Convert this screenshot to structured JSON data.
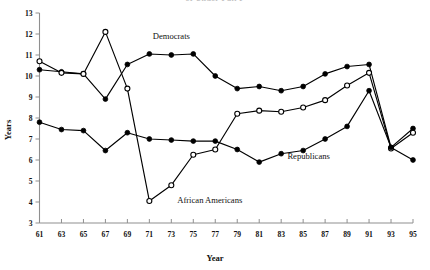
{
  "page": {
    "top_partial_title": "of Under Full P"
  },
  "chart_data": {
    "type": "line",
    "title": "",
    "xlabel": "Year",
    "ylabel": "Years",
    "xlim": [
      61,
      95
    ],
    "ylim": [
      3,
      13
    ],
    "grid": false,
    "legend": "inline-annotations",
    "x_tick_labels": [
      "61",
      "63",
      "65",
      "67",
      "69",
      "71",
      "73",
      "75",
      "77",
      "79",
      "81",
      "83",
      "85",
      "87",
      "89",
      "91",
      "93",
      "95"
    ],
    "y_tick_labels": [
      "3",
      "4",
      "5",
      "6",
      "7",
      "8",
      "9",
      "10",
      "11",
      "12",
      "13"
    ],
    "categories": [
      61,
      63,
      65,
      67,
      69,
      71,
      73,
      75,
      77,
      79,
      81,
      83,
      85,
      87,
      89,
      91,
      93,
      95
    ],
    "series": [
      {
        "name": "Democrats",
        "marker": "filled-circle",
        "label_x": 73,
        "label_y": 11.75,
        "values": [
          10.3,
          10.2,
          10.1,
          8.9,
          10.55,
          11.05,
          11.0,
          11.05,
          10.0,
          9.4,
          9.5,
          9.3,
          9.5,
          10.1,
          10.45,
          10.55,
          6.6,
          7.5
        ]
      },
      {
        "name": "African Americans",
        "marker": "open-circle",
        "label_x": 76.5,
        "label_y": 3.95,
        "values": [
          10.7,
          10.15,
          10.1,
          12.1,
          9.4,
          4.05,
          4.8,
          6.25,
          6.5,
          8.2,
          8.35,
          8.3,
          8.5,
          8.85,
          9.55,
          10.15,
          6.55,
          7.3
        ]
      },
      {
        "name": "Republicans",
        "marker": "filled-circle",
        "label_x": 85.5,
        "label_y": 6.05,
        "values": [
          7.8,
          7.45,
          7.4,
          6.45,
          7.3,
          7.0,
          6.95,
          6.9,
          6.9,
          6.5,
          5.9,
          6.3,
          6.45,
          7.0,
          7.6,
          9.3,
          6.6,
          6.0
        ]
      }
    ]
  }
}
